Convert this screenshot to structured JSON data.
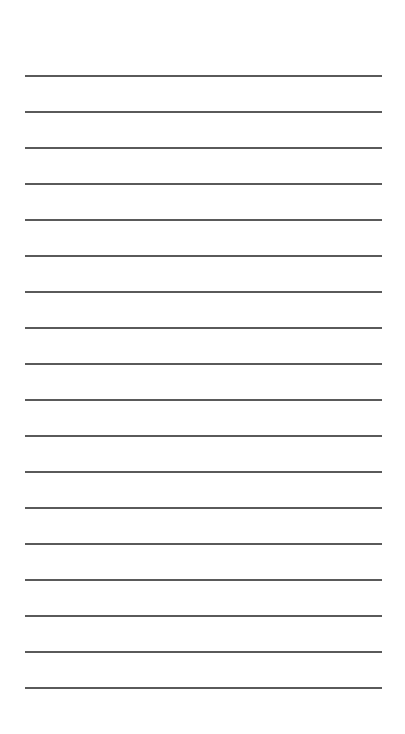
{
  "page": {
    "type": "lined-paper",
    "background": "#ffffff",
    "line_color": "#5a5a5a",
    "line_count": 18,
    "first_line_y": 75,
    "line_spacing": 36,
    "line_left": 25,
    "line_right": 382
  }
}
